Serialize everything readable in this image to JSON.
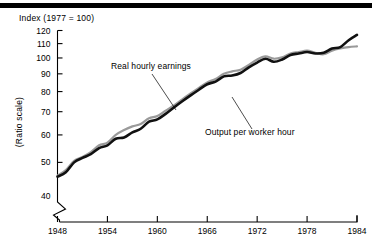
{
  "figure": {
    "y_axis_title": "Index (1977 = 100)",
    "y_axis_scale_note": "(Ratio scale)",
    "rule_color": "#000000"
  },
  "chart_data": {
    "type": "line",
    "title": "Index (1977 = 100)",
    "subtitle": "",
    "xlabel": "",
    "ylabel": "Index (1977 = 100)",
    "y_scale": "log",
    "y_scale_label": "(Ratio scale)",
    "grid": false,
    "legend_position": "inline-annotations",
    "axis_break": true,
    "xlim": [
      1948,
      1984
    ],
    "ylim": [
      40,
      120
    ],
    "xticks": [
      1948,
      1954,
      1960,
      1966,
      1972,
      1978,
      1984
    ],
    "xticklabels": [
      "1948",
      "1954",
      "1960",
      "1966",
      "1972",
      "1978",
      "1984"
    ],
    "yticks": [
      40,
      50,
      60,
      70,
      80,
      90,
      100,
      110,
      120
    ],
    "yticklabels": [
      "40",
      "50",
      "60",
      "70",
      "80",
      "90",
      "100",
      "110",
      "120"
    ],
    "annotations": [
      {
        "text": "Real hourly earnings",
        "series": "Real hourly earnings"
      },
      {
        "text": "Output per worker hour",
        "series": "Output per worker hour"
      }
    ],
    "x": [
      1948,
      1949,
      1950,
      1951,
      1952,
      1953,
      1954,
      1955,
      1956,
      1957,
      1958,
      1959,
      1960,
      1961,
      1962,
      1963,
      1964,
      1965,
      1966,
      1967,
      1968,
      1969,
      1970,
      1971,
      1972,
      1973,
      1974,
      1975,
      1976,
      1977,
      1978,
      1979,
      1980,
      1981,
      1982,
      1983,
      1984
    ],
    "series": [
      {
        "name": "Output per worker hour",
        "color": "#111111",
        "linewidth": 2.6,
        "values": [
          45.5,
          46.8,
          50.0,
          51.5,
          52.8,
          55.0,
          56.0,
          58.5,
          59.0,
          61.0,
          62.5,
          65.5,
          66.5,
          69.0,
          72.0,
          75.0,
          78.0,
          81.0,
          84.0,
          85.5,
          88.5,
          89.0,
          90.5,
          94.0,
          97.0,
          99.5,
          97.5,
          99.0,
          102.0,
          103.0,
          104.0,
          103.0,
          103.5,
          106.5,
          107.5,
          112.5,
          116.5
        ]
      },
      {
        "name": "Real hourly earnings",
        "color": "#9a9a9a",
        "linewidth": 2.2,
        "values": [
          45.8,
          47.5,
          50.5,
          51.8,
          53.5,
          56.0,
          57.0,
          60.0,
          62.0,
          63.5,
          64.5,
          67.0,
          68.0,
          70.5,
          73.0,
          76.0,
          79.0,
          82.0,
          85.0,
          87.0,
          90.0,
          91.5,
          92.5,
          95.5,
          99.0,
          101.0,
          99.5,
          100.5,
          103.0,
          104.0,
          105.0,
          103.5,
          102.5,
          105.0,
          106.5,
          107.5,
          108.0
        ]
      }
    ]
  }
}
